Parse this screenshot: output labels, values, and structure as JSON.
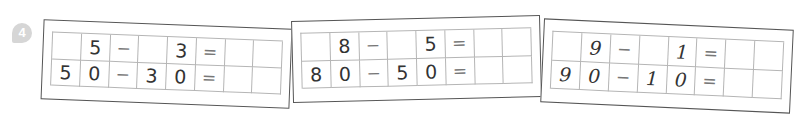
{
  "exercise": {
    "number": "4",
    "badge_color": "#d6d6d6",
    "cards": [
      {
        "rows": [
          [
            "",
            "5",
            "−",
            "",
            "3",
            "=",
            "",
            ""
          ],
          [
            "5",
            "0",
            "−",
            "3",
            "0",
            "=",
            "",
            ""
          ]
        ]
      },
      {
        "rows": [
          [
            "",
            "8",
            "−",
            "",
            "5",
            "=",
            "",
            ""
          ],
          [
            "8",
            "0",
            "−",
            "5",
            "0",
            "=",
            "",
            ""
          ]
        ]
      },
      {
        "rows": [
          [
            "",
            "9",
            "−",
            "",
            "1",
            "=",
            "",
            ""
          ],
          [
            "9",
            "0",
            "−",
            "1",
            "0",
            "=",
            "",
            ""
          ]
        ]
      }
    ]
  }
}
